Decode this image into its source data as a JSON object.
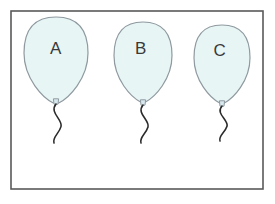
{
  "figure": {
    "background_color": "#ffffff",
    "frame": {
      "name": "outer-frame",
      "x": 11,
      "y": 11,
      "width": 252,
      "height": 178,
      "stroke_color": "#595959",
      "fill_color": "#ffffff",
      "stroke_width": 1.6
    },
    "balloon_style": {
      "fill_color": "#e8f5f5",
      "outline_color": "#8f9aa0",
      "outline_width": 1.2,
      "string_color": "#2b2b2b",
      "string_width": 1.6,
      "knot_fill": "#d7e9ee",
      "label_color": "#3a3a3a"
    },
    "balloons": [
      {
        "id": "balloon-a",
        "label": "A",
        "center_x": 56,
        "top_y": 17,
        "width": 64,
        "height": 86,
        "label_x": 56,
        "label_y": 50,
        "knot_x": 56,
        "knot_y": 101,
        "string_end_y": 143
      },
      {
        "id": "balloon-b",
        "label": "B",
        "center_x": 143,
        "top_y": 22,
        "width": 58,
        "height": 80,
        "label_x": 141,
        "label_y": 50,
        "knot_x": 143,
        "knot_y": 102,
        "string_end_y": 143
      },
      {
        "id": "balloon-c",
        "label": "C",
        "center_x": 222,
        "top_y": 25,
        "width": 56,
        "height": 78,
        "label_x": 220,
        "label_y": 52,
        "knot_x": 222,
        "knot_y": 103,
        "string_end_y": 141
      }
    ]
  }
}
